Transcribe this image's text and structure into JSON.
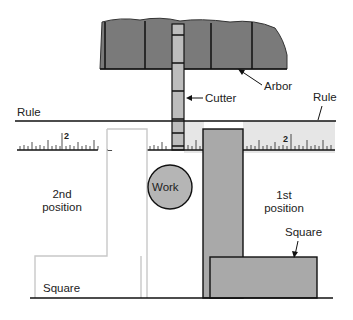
{
  "figure": {
    "labels": {
      "arbor": "Arbor",
      "cutter": "Cutter",
      "rule_left": "Rule",
      "rule_right": "Rule",
      "ruler_mark_left": "2",
      "ruler_mark_right": "2",
      "work": "Work",
      "second_position_line1": "2nd",
      "second_position_line2": "position",
      "first_position_line1": "1st",
      "first_position_line2": "position",
      "square_left": "Square",
      "square_right": "Square"
    },
    "colors": {
      "arbor_fill": "#7a7a7a",
      "cutter_fill": "#bdbdbd",
      "work_fill": "#b5b5b5",
      "ruler_band": "#e6e6e6",
      "square_gray": "#a9a9a9",
      "square_white_outline": "#c8c8c8",
      "line": "#1a1a1a"
    }
  }
}
